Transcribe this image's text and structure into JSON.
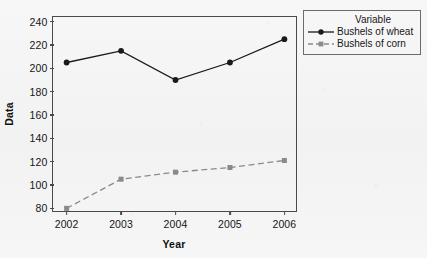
{
  "chart_data": {
    "type": "line",
    "title": "",
    "xlabel": "Year",
    "ylabel": "Data",
    "x": [
      2002,
      2003,
      2004,
      2005,
      2006
    ],
    "xtick_labels": [
      "2002",
      "2003",
      "2004",
      "2005",
      "2006"
    ],
    "ytick_labels": [
      "80",
      "100",
      "120",
      "140",
      "160",
      "180",
      "200",
      "220",
      "240"
    ],
    "yticks": [
      80,
      100,
      120,
      140,
      160,
      180,
      200,
      220,
      240
    ],
    "ylim": [
      76,
      244
    ],
    "xlim": [
      2001.75,
      2006.25
    ],
    "grid": false,
    "legend_position": "right",
    "legend_title": "Variable",
    "series": [
      {
        "name": "Bushels of wheat",
        "values": [
          205,
          215,
          190,
          205,
          225
        ],
        "color": "#1a1a1a",
        "marker": "circle",
        "linestyle": "solid"
      },
      {
        "name": "Bushels of corn",
        "values": [
          80,
          105,
          111,
          115,
          121
        ],
        "color": "#8a8a8a",
        "marker": "square",
        "linestyle": "dashed"
      }
    ]
  },
  "axis": {
    "y_title": "Data",
    "x_title": "Year"
  },
  "legend": {
    "title": "Variable",
    "items": [
      {
        "label": "Bushels of wheat"
      },
      {
        "label": "Bushels of corn"
      }
    ]
  },
  "colors": {
    "wheat": "#1a1a1a",
    "corn": "#8a8a8a",
    "frame": "#4a4a4a",
    "background": "#f5f5f5"
  }
}
